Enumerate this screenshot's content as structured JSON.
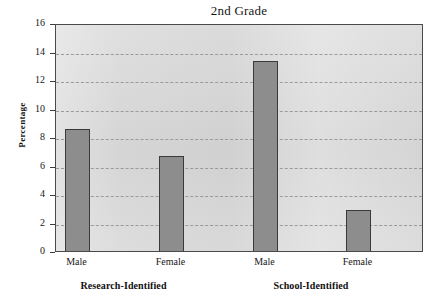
{
  "chart_data": {
    "type": "bar",
    "title": "2nd Grade",
    "xlabel": "",
    "ylabel": "Percentage",
    "ylim": [
      0,
      16
    ],
    "ytick_values": [
      0,
      2,
      4,
      6,
      8,
      10,
      12,
      14,
      16
    ],
    "ytick_labels": [
      "0",
      "2",
      "4",
      "6",
      "8",
      "10",
      "12",
      "14",
      "16"
    ],
    "grid": true,
    "legend": "none",
    "categories": [
      "Male",
      "Female",
      "Male",
      "Female"
    ],
    "groups": [
      {
        "label": "Research-Identified",
        "categories": [
          "Male",
          "Female"
        ],
        "values": [
          8.7,
          6.8
        ]
      },
      {
        "label": "School-Identified",
        "categories": [
          "Male",
          "Female"
        ],
        "values": [
          13.5,
          3.05
        ]
      }
    ],
    "values": [
      8.7,
      6.8,
      13.5,
      3.05
    ],
    "bars": [
      {
        "id": "research-male",
        "group": "Research-Identified",
        "category": "Male",
        "value": 8.7,
        "x": 64,
        "width": 25
      },
      {
        "id": "research-female",
        "group": "Research-Identified",
        "category": "Female",
        "width": 25,
        "value": 6.8,
        "x": 158
      },
      {
        "id": "school-male",
        "group": "School-Identified",
        "category": "Male",
        "value": 13.5,
        "x": 252,
        "width": 25
      },
      {
        "id": "school-female",
        "group": "School-Identified",
        "category": "Female",
        "value": 3.05,
        "x": 345,
        "width": 25
      }
    ],
    "colors": {
      "bar_fill": "#8d8d8d",
      "bar_edge": "#3a3a3a",
      "plot_background": "#d8d8d8",
      "gridline": "#9a9a9a",
      "axis": "#4a4a4a",
      "text": "#171717",
      "figure_background": "#ffffff"
    }
  },
  "axis": {
    "y_title": "Percentage",
    "ticks": [
      {
        "label": "16",
        "value": 16
      },
      {
        "label": "14",
        "value": 14
      },
      {
        "label": "12",
        "value": 12
      },
      {
        "label": "10",
        "value": 10
      },
      {
        "label": "8",
        "value": 8
      },
      {
        "label": "6",
        "value": 6
      },
      {
        "label": "4",
        "value": 4
      },
      {
        "label": "2",
        "value": 2
      },
      {
        "label": "0",
        "value": 0
      }
    ]
  },
  "x_labels": [
    {
      "text": "Male"
    },
    {
      "text": "Female"
    },
    {
      "text": "Male"
    },
    {
      "text": "Female"
    }
  ],
  "group_labels": [
    {
      "text": "Research-Identified"
    },
    {
      "text": "School-Identified"
    }
  ]
}
